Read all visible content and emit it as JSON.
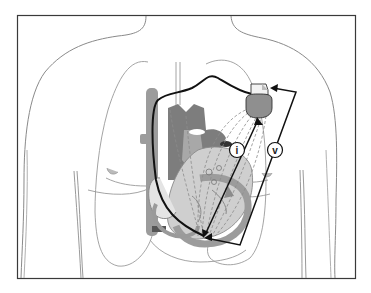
{
  "figure": {
    "labels": {
      "current": "i",
      "voltage": "v"
    },
    "colors": {
      "frame": "#3a3a3a",
      "outline": "#8a8a8a",
      "lung_outline": "#9a9a9a",
      "heart_dark": "#7d7d7d",
      "heart_mid": "#a6a6a6",
      "heart_light": "#c8c8c8",
      "lead": "#111111",
      "device_body": "#8f8f8f",
      "device_header": "#f2f2f2",
      "dashed_field": "#8c8c8c"
    }
  }
}
